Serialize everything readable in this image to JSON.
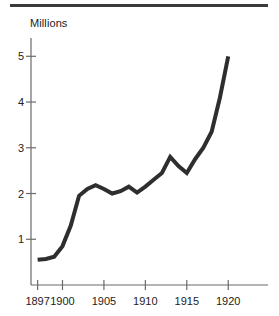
{
  "figure": {
    "background_color": "#ffffff",
    "rule_color": "#3a3a3a",
    "line_color": "#2e2e2e",
    "axis_color": "#6b6b6b",
    "text_color": "#222222"
  },
  "chart_data": {
    "type": "line",
    "title": "",
    "subtitle": "",
    "ylabel": "Millions",
    "xlabel": "",
    "grid": false,
    "legend": null,
    "legend_position": "none",
    "xlim": [
      1896.2,
      1924.8
    ],
    "ylim": [
      0,
      5.4
    ],
    "ytick_labels": [
      "1",
      "2",
      "3",
      "4",
      "5"
    ],
    "ytick_values": [
      1,
      2,
      3,
      4,
      5
    ],
    "xtick_labels": [
      "1897",
      "1900",
      "1905",
      "1910",
      "1915",
      "1920"
    ],
    "xtick_values": [
      1897,
      1900,
      1905,
      1910,
      1915,
      1920
    ],
    "x": [
      1897,
      1898,
      1899,
      1900,
      1901,
      1902,
      1903,
      1904,
      1905,
      1906,
      1907,
      1908,
      1909,
      1910,
      1911,
      1912,
      1913,
      1914,
      1915,
      1916,
      1917,
      1918,
      1919,
      1920
    ],
    "values": [
      0.55,
      0.57,
      0.62,
      0.85,
      1.3,
      1.95,
      2.1,
      2.18,
      2.1,
      2.0,
      2.05,
      2.15,
      2.02,
      2.15,
      2.3,
      2.45,
      2.8,
      2.6,
      2.45,
      2.75,
      3.0,
      3.35,
      4.1,
      5.0
    ],
    "series": [
      {
        "name": "Millions",
        "values": [
          0.55,
          0.57,
          0.62,
          0.85,
          1.3,
          1.95,
          2.1,
          2.18,
          2.1,
          2.0,
          2.05,
          2.15,
          2.02,
          2.15,
          2.3,
          2.45,
          2.8,
          2.6,
          2.45,
          2.75,
          3.0,
          3.35,
          4.1,
          5.0
        ]
      }
    ]
  }
}
